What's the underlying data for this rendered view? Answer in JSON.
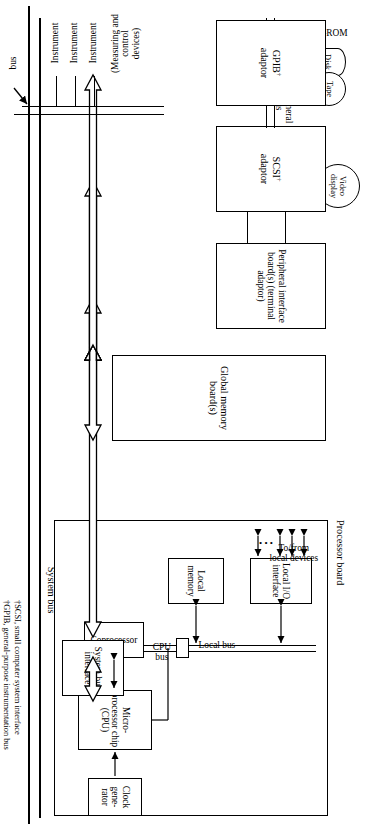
{
  "diagram": {
    "system_bus_label": "System bus",
    "processor_board": {
      "label": "Processor board",
      "blocks": {
        "cpu": "Micro-\nprocessor\nchip\n(CPU)",
        "coprocessor": "Coprocessor",
        "clock": "Clock\ngene-\nrator",
        "local_memory": "Local\nmemory",
        "local_io": "Local\nI/O\ninterface",
        "system_bus_interface": "System bus\ninterface"
      },
      "bus_labels": {
        "cpu_bus": "CPU\nbus",
        "local_bus": "Local bus"
      },
      "io_label": "To/from\nlocal devices",
      "io_ellipsis": "• • •"
    },
    "global_memory": {
      "label": "Global\nmemory\nboard(s)"
    },
    "peripheral_interface": {
      "label": "Peripheral\ninterface\nboard(s)\n(terminal\nadaptor)",
      "serial_links_label": "Serial\nlinks",
      "devices": [
        "Video\ndisplay",
        "Video\ndisplay"
      ]
    },
    "scsi": {
      "label": "SCSI",
      "dagger": "†",
      "sublabel": "adaptor",
      "bus_label": "Peripheral\nbus",
      "devices": [
        "CD-ROM",
        "Disk",
        "Tape"
      ]
    },
    "gpib": {
      "label": "GPIB",
      "dagger": "†",
      "sublabel": "adaptor",
      "bus_label": "bus",
      "devices": [
        "Instrument",
        "Instrument",
        "Instrument"
      ],
      "devices_note": "(Measuring and\ncontrol\ndevices)"
    },
    "footnotes": [
      "†SCSI, small computer system interface",
      "†GPIB, general-purpose instrumentation bus"
    ]
  }
}
